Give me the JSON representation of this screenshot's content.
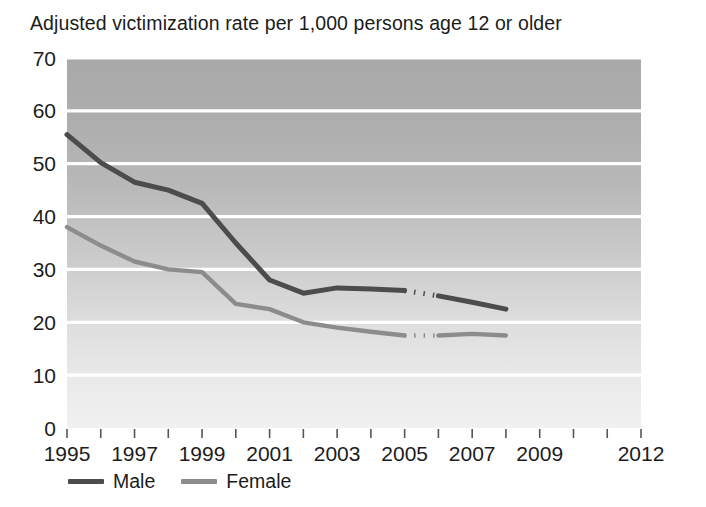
{
  "chart_data": {
    "type": "line",
    "title": "Adjusted victimization rate per 1,000 persons age 12 or older",
    "xlabel": "",
    "ylabel": "",
    "xlim": [
      1995,
      2012
    ],
    "ylim": [
      0,
      70
    ],
    "ytick_values": [
      0,
      10,
      20,
      30,
      40,
      50,
      60,
      70
    ],
    "ytick_labels": [
      "0",
      "10",
      "20",
      "30",
      "40",
      "50",
      "60",
      "70"
    ],
    "xtick_values": [
      1995,
      1996,
      1997,
      1998,
      1999,
      2000,
      2001,
      2002,
      2003,
      2004,
      2005,
      2006,
      2007,
      2008,
      2009,
      2010,
      2011,
      2012
    ],
    "xtick_labels": [
      "1995",
      "",
      "1997",
      "",
      "1999",
      "",
      "2001",
      "",
      "2003",
      "",
      "2005",
      "",
      "2007",
      "",
      "2009",
      "",
      "",
      "2012"
    ],
    "grid": "horizontal",
    "legend_position": "below-left",
    "background": "vertical-gradient-gray",
    "series": [
      {
        "name": "Male",
        "color": "#4c4c4c",
        "x": [
          1995,
          1996,
          1997,
          1998,
          1999,
          2000,
          2001,
          2002,
          2003,
          2004,
          2005,
          2006,
          2007,
          2008
        ],
        "values": [
          55.5,
          50.2,
          46.5,
          45.0,
          42.5,
          35.0,
          28.0,
          25.5,
          26.5,
          26.3,
          26.0,
          25.0,
          23.8,
          22.5
        ],
        "dashed_segment_x": [
          2005,
          2006
        ],
        "dashed_segment_values": [
          26.0,
          25.0
        ]
      },
      {
        "name": "Female",
        "color": "#8c8c8c",
        "x": [
          1995,
          1996,
          1997,
          1998,
          1999,
          2000,
          2001,
          2002,
          2003,
          2004,
          2005,
          2006,
          2007,
          2008
        ],
        "values": [
          38.0,
          34.5,
          31.5,
          30.0,
          29.5,
          23.5,
          22.5,
          20.0,
          19.0,
          18.2,
          17.5,
          17.5,
          17.8,
          17.5
        ],
        "dashed_segment_x": [
          2005,
          2006
        ],
        "dashed_segment_values": [
          17.5,
          17.5
        ]
      }
    ],
    "legend": [
      {
        "label": "Male",
        "color": "#4c4c4c"
      },
      {
        "label": "Female",
        "color": "#8c8c8c"
      }
    ]
  }
}
